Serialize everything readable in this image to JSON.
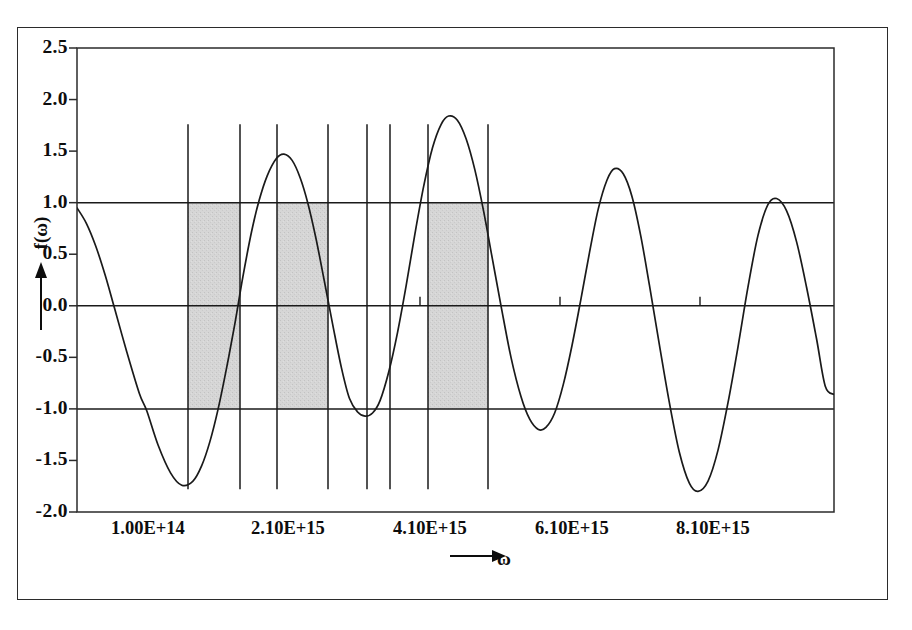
{
  "chart_data": {
    "type": "line",
    "title": "",
    "xlabel": "ω",
    "ylabel": "f(ω)",
    "ylim": [
      -2.0,
      2.5
    ],
    "ytick_labels": [
      "2.5",
      "2.0",
      "1.5",
      "1.0",
      "0.5",
      "0.0",
      "-0.5",
      "-1.0",
      "-1.5",
      "-2.0"
    ],
    "ytick_values": [
      2.5,
      2.0,
      1.5,
      1.0,
      0.5,
      0.0,
      -0.5,
      -1.0,
      -1.5,
      -2.0
    ],
    "xtick_labels": [
      "1.00E+14",
      "2.10E+15",
      "4.10E+15",
      "6.10E+15",
      "8.10E+15"
    ],
    "xtick_values": [
      100000000000000.0,
      2100000000000000.0,
      4100000000000000.0,
      6100000000000000.0,
      8100000000000000.0
    ],
    "grid": false,
    "legend": "none",
    "reference_lines": [
      {
        "name": "upper-unit-line",
        "y": 1.0
      },
      {
        "name": "zero-line",
        "y": 0.0
      },
      {
        "name": "lower-unit-line",
        "y": -1.0
      }
    ],
    "series": [
      {
        "name": "f(omega)",
        "description": "chirped oscillation with varying amplitude",
        "points": [
          {
            "x": 0.0,
            "y": 0.95
          },
          {
            "x": 0.015,
            "y": 0.8
          },
          {
            "x": 0.03,
            "y": 0.58
          },
          {
            "x": 0.045,
            "y": 0.3
          },
          {
            "x": 0.06,
            "y": -0.02
          },
          {
            "x": 0.08,
            "y": -0.45
          },
          {
            "x": 0.1,
            "y": -0.85
          },
          {
            "x": 0.112,
            "y": -1.02
          },
          {
            "x": 0.13,
            "y": -1.35
          },
          {
            "x": 0.15,
            "y": -1.62
          },
          {
            "x": 0.168,
            "y": -1.74
          },
          {
            "x": 0.186,
            "y": -1.7
          },
          {
            "x": 0.2,
            "y": -1.55
          },
          {
            "x": 0.213,
            "y": -1.32
          },
          {
            "x": 0.226,
            "y": -1.01
          },
          {
            "x": 0.24,
            "y": -0.6
          },
          {
            "x": 0.253,
            "y": -0.18
          },
          {
            "x": 0.266,
            "y": 0.28
          },
          {
            "x": 0.28,
            "y": 0.72
          },
          {
            "x": 0.292,
            "y": 1.02
          },
          {
            "x": 0.305,
            "y": 1.26
          },
          {
            "x": 0.32,
            "y": 1.43
          },
          {
            "x": 0.332,
            "y": 1.47
          },
          {
            "x": 0.345,
            "y": 1.41
          },
          {
            "x": 0.358,
            "y": 1.24
          },
          {
            "x": 0.37,
            "y": 1.0
          },
          {
            "x": 0.383,
            "y": 0.66
          },
          {
            "x": 0.396,
            "y": 0.26
          },
          {
            "x": 0.41,
            "y": -0.18
          },
          {
            "x": 0.424,
            "y": -0.6
          },
          {
            "x": 0.437,
            "y": -0.9
          },
          {
            "x": 0.45,
            "y": -1.03
          },
          {
            "x": 0.462,
            "y": -1.07
          },
          {
            "x": 0.474,
            "y": -1.04
          },
          {
            "x": 0.486,
            "y": -0.92
          },
          {
            "x": 0.5,
            "y": -0.64
          },
          {
            "x": 0.514,
            "y": -0.26
          },
          {
            "x": 0.528,
            "y": 0.2
          },
          {
            "x": 0.542,
            "y": 0.7
          },
          {
            "x": 0.556,
            "y": 1.16
          },
          {
            "x": 0.57,
            "y": 1.53
          },
          {
            "x": 0.584,
            "y": 1.76
          },
          {
            "x": 0.596,
            "y": 1.84
          },
          {
            "x": 0.61,
            "y": 1.8
          },
          {
            "x": 0.624,
            "y": 1.62
          },
          {
            "x": 0.638,
            "y": 1.32
          },
          {
            "x": 0.652,
            "y": 0.92
          },
          {
            "x": 0.666,
            "y": 0.46
          },
          {
            "x": 0.68,
            "y": 0.0
          },
          {
            "x": 0.696,
            "y": -0.5
          },
          {
            "x": 0.712,
            "y": -0.88
          },
          {
            "x": 0.726,
            "y": -1.1
          },
          {
            "x": 0.74,
            "y": -1.2
          },
          {
            "x": 0.752,
            "y": -1.18
          },
          {
            "x": 0.766,
            "y": -1.04
          },
          {
            "x": 0.78,
            "y": -0.76
          },
          {
            "x": 0.794,
            "y": -0.38
          },
          {
            "x": 0.808,
            "y": 0.06
          },
          {
            "x": 0.822,
            "y": 0.52
          },
          {
            "x": 0.836,
            "y": 0.94
          },
          {
            "x": 0.85,
            "y": 1.22
          },
          {
            "x": 0.862,
            "y": 1.33
          },
          {
            "x": 0.876,
            "y": 1.28
          },
          {
            "x": 0.89,
            "y": 1.06
          },
          {
            "x": 0.904,
            "y": 0.68
          },
          {
            "x": 0.918,
            "y": 0.2
          },
          {
            "x": 0.934,
            "y": -0.38
          },
          {
            "x": 0.95,
            "y": -0.94
          },
          {
            "x": 0.966,
            "y": -1.42
          },
          {
            "x": 0.982,
            "y": -1.72
          },
          {
            "x": 0.996,
            "y": -1.8
          },
          {
            "x": 1.012,
            "y": -1.7
          },
          {
            "x": 1.028,
            "y": -1.4
          },
          {
            "x": 1.044,
            "y": -0.94
          },
          {
            "x": 1.06,
            "y": -0.4
          },
          {
            "x": 1.076,
            "y": 0.18
          },
          {
            "x": 1.092,
            "y": 0.68
          },
          {
            "x": 1.108,
            "y": 0.98
          },
          {
            "x": 1.122,
            "y": 1.04
          },
          {
            "x": 1.138,
            "y": 0.92
          },
          {
            "x": 1.154,
            "y": 0.62
          },
          {
            "x": 1.17,
            "y": 0.18
          },
          {
            "x": 1.186,
            "y": -0.32
          },
          {
            "x": 1.2,
            "y": -0.78
          },
          {
            "x": 1.214,
            "y": -0.86
          }
        ]
      }
    ],
    "vertical_lines": [
      {
        "name": "vline-1",
        "x_px": 188
      },
      {
        "name": "vline-2",
        "x_px": 240
      },
      {
        "name": "vline-3",
        "x_px": 277
      },
      {
        "name": "vline-4",
        "x_px": 328
      },
      {
        "name": "vline-5",
        "x_px": 367
      },
      {
        "name": "vline-6",
        "x_px": 390
      },
      {
        "name": "vline-7",
        "x_px": 428
      },
      {
        "name": "vline-8",
        "x_px": 488
      }
    ],
    "shaded_bands": [
      {
        "name": "band-1",
        "x_start_px": 188,
        "x_end_px": 240,
        "y_top": 1.0,
        "y_bottom": -1.0
      },
      {
        "name": "band-2",
        "x_start_px": 277,
        "x_end_px": 328,
        "y_top": 1.0,
        "y_bottom": -1.0
      },
      {
        "name": "band-3",
        "x_start_px": 428,
        "x_end_px": 488,
        "y_top": 1.0,
        "y_bottom": -1.0
      }
    ],
    "zero_line_ticks_px": [
      420,
      560,
      700
    ],
    "colors": {
      "curve": "#1a1a1a",
      "band_fill": "#d4d4d4",
      "axis": "#2b2b2b",
      "text": "#0d0d0d",
      "background": "#ffffff"
    }
  }
}
